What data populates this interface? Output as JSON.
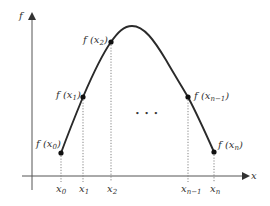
{
  "figure": {
    "type": "diagram",
    "axes": {
      "y_label": "f",
      "x_label": "x"
    },
    "ellipsis": "• • •",
    "points": [
      {
        "x_label_base": "x",
        "x_label_sub": "0",
        "f_label_prefix": "f (x",
        "f_label_sub": "0",
        "f_label_suffix": ")"
      },
      {
        "x_label_base": "x",
        "x_label_sub": "1",
        "f_label_prefix": "f (x",
        "f_label_sub": "1",
        "f_label_suffix": ")"
      },
      {
        "x_label_base": "x",
        "x_label_sub": "2",
        "f_label_prefix": "f (x",
        "f_label_sub": "2",
        "f_label_suffix": ")"
      },
      {
        "x_label_base": "x",
        "x_label_sub": "n−1",
        "f_label_prefix": "f (x",
        "f_label_sub": "n−1",
        "f_label_suffix": ")"
      },
      {
        "x_label_base": "x",
        "x_label_sub": "n",
        "f_label_prefix": "f (x",
        "f_label_sub": "n",
        "f_label_suffix": ")"
      }
    ],
    "colors": {
      "curve": "#2a2a2a",
      "axis": "#444444",
      "guide": "#777777",
      "text": "#333333"
    }
  }
}
